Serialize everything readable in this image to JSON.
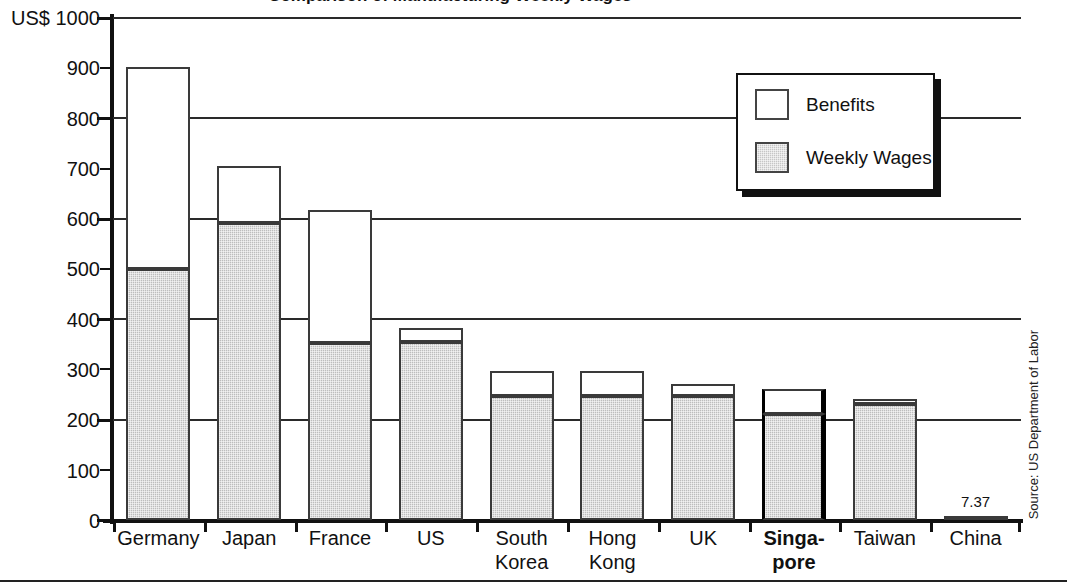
{
  "chart_data": {
    "type": "bar",
    "subtype": "stacked-vertical",
    "title": "",
    "xlabel": "",
    "ylabel": "US$ 1000",
    "ylim": [
      0,
      1000
    ],
    "ytick_labels": [
      "0",
      "100",
      "200",
      "300",
      "400",
      "500",
      "600",
      "700",
      "800",
      "900",
      "US$ 1000"
    ],
    "ytick_values": [
      0,
      100,
      200,
      300,
      400,
      500,
      600,
      700,
      800,
      900,
      1000
    ],
    "gridlines_at": [
      200,
      400,
      600,
      800,
      1000
    ],
    "grid": true,
    "legend_position": "top-right",
    "categories": [
      "Germany",
      "Japan",
      "France",
      "US",
      "South\nKorea",
      "Hong\nKong",
      "UK",
      "Singa-\npore",
      "Taiwan",
      "China"
    ],
    "series": [
      {
        "name": "Weekly Wages",
        "color": "#c6c6c6",
        "values": [
          500,
          592,
          353,
          355,
          248,
          248,
          248,
          212,
          231,
          7.37
        ]
      },
      {
        "name": "Benefits",
        "color": "#ffffff",
        "values": [
          403,
          113,
          265,
          28,
          49,
          48,
          22,
          48,
          10,
          0
        ]
      }
    ],
    "totals": [
      903,
      705,
      618,
      383,
      297,
      296,
      270,
      260,
      241,
      7.37
    ],
    "data_labels": {
      "China": "7.37"
    },
    "highlighted_category": "Singa-\npore",
    "annotations": {
      "source": "Source: US Department of Labor"
    }
  },
  "legend": {
    "items": [
      {
        "label": "Benefits",
        "swatch": "benefits"
      },
      {
        "label": "Weekly Wages",
        "swatch": "wages"
      }
    ]
  },
  "axis": {
    "y_top_label": "US$ 1000",
    "labels": [
      "900",
      "800",
      "700",
      "600",
      "500",
      "400",
      "300",
      "200",
      "100",
      "0"
    ]
  },
  "source_note": "Source: US Department of Labor",
  "title_sliver": "Comparison of Manufacturing Weekly Wages"
}
